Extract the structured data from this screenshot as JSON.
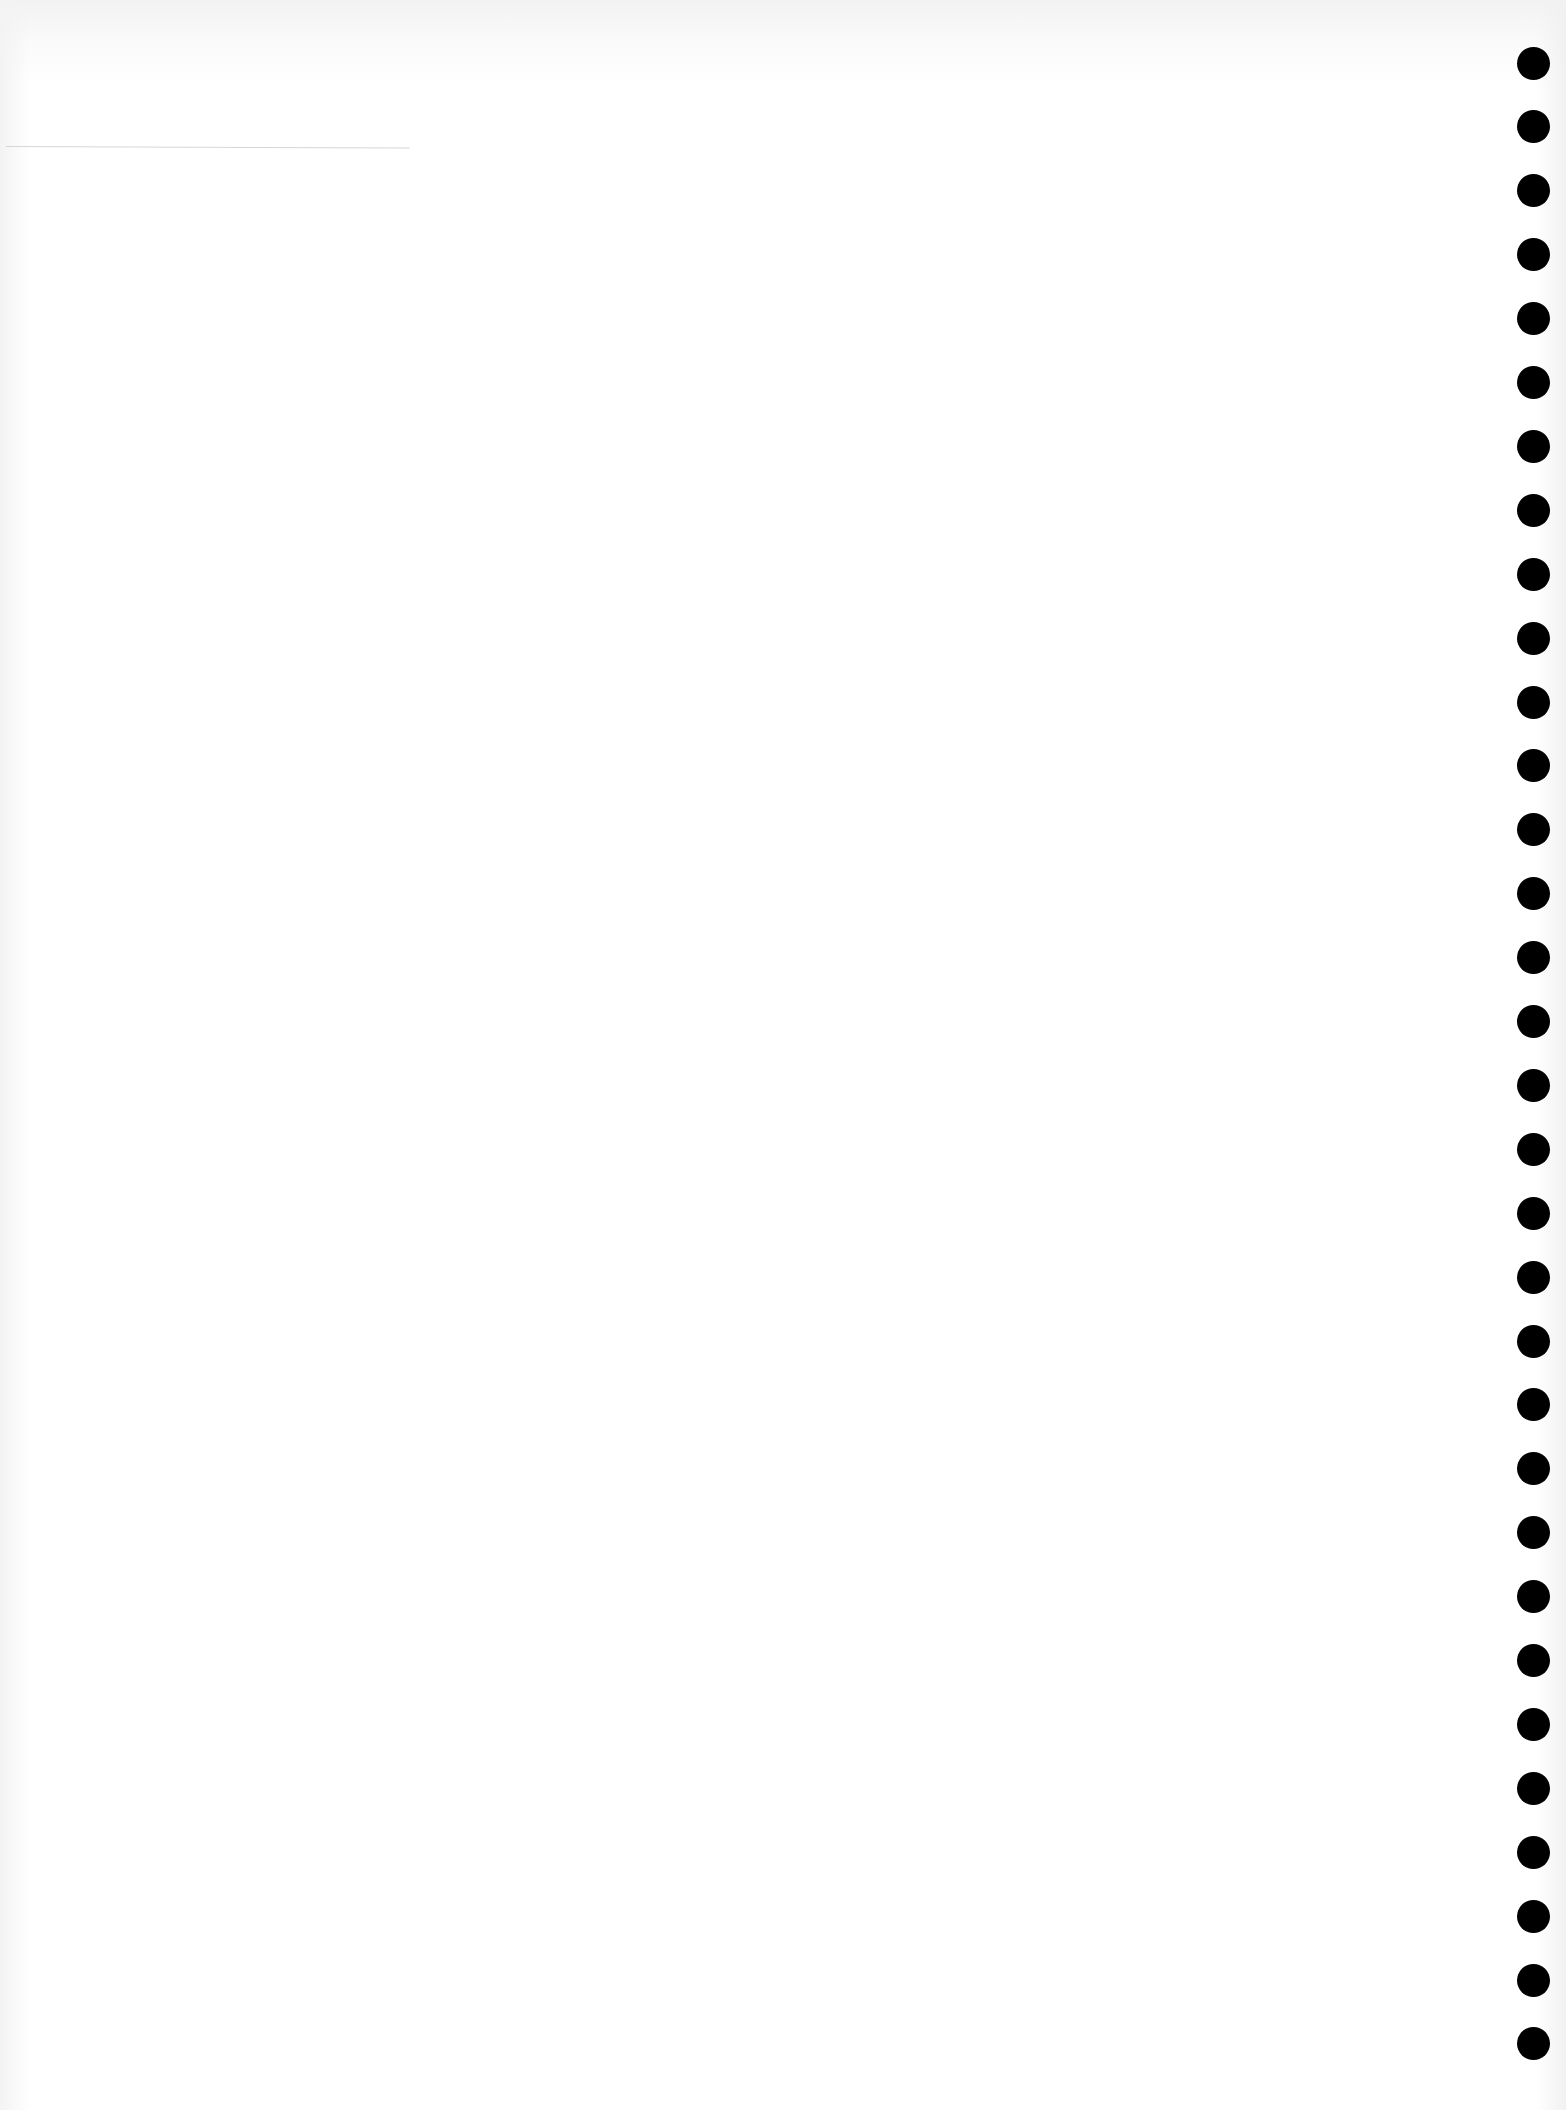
{
  "page": {
    "background_color": "#ffffff",
    "hole_color": "#000000",
    "rule_color": "#d6d6d6"
  },
  "binder_holes": {
    "count": 32,
    "first_center_y": 63,
    "spacing": 63.9,
    "center_x": 1533,
    "diameter": 33
  }
}
